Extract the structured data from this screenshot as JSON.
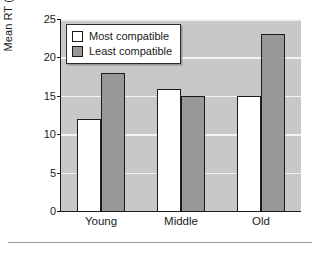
{
  "chart_data": {
    "type": "bar",
    "title": "",
    "subtitle": "",
    "xlabel": "",
    "ylabel": "Mean RT (ms)",
    "categories": [
      "Young",
      "Middle",
      "Old"
    ],
    "series": [
      {
        "name": "Most compatible",
        "color": "#ffffff",
        "values": [
          12,
          15.9,
          15
        ]
      },
      {
        "name": "Least compatible",
        "color": "#989898",
        "values": [
          18,
          15,
          23
        ]
      }
    ],
    "ylim": [
      0,
      25
    ],
    "yticks": [
      0,
      5,
      10,
      15,
      20,
      25
    ],
    "ytick_labels": [
      "0",
      "5",
      "10",
      "15",
      "20",
      "25"
    ],
    "grid": true,
    "grid_axis": "y",
    "legend_position": "upper left",
    "plot_background": "#c8c8c8",
    "gridline_color": "#f2f2f2",
    "axis_color": "#1a1a1a",
    "bar_edge_color": "#1a1a1a"
  },
  "footer": {
    "rule_color": "#9a9a9a"
  }
}
